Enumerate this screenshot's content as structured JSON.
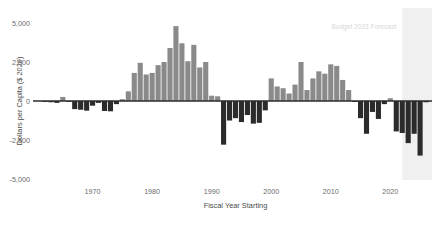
{
  "chart_data": {
    "type": "bar",
    "title": "",
    "xlabel": "Fiscal Year Starting",
    "ylabel": "Dollars per Capita ($ 2020)",
    "xlim": [
      1961,
      2027
    ],
    "ylim": [
      -5000,
      5000
    ],
    "grid": false,
    "legend": null,
    "yticks": [
      5000,
      2500,
      0,
      -2500,
      -5000
    ],
    "ytick_labels": [
      "5,000",
      "2,500",
      "0",
      "-2,500",
      "-5,000"
    ],
    "xticks": [
      1970,
      1980,
      1990,
      2000,
      2010,
      2020
    ],
    "xtick_labels": [
      "1970",
      "1980",
      "1990",
      "2000",
      "2010",
      "2020"
    ],
    "annotations": [
      {
        "text": "Budget 2023 Forecast",
        "x": 2021,
        "y": 4600,
        "color": "#d8d8d8"
      }
    ],
    "shaded_regions": [
      {
        "name": "forecast-band",
        "x_start": 2022,
        "x_end": 2027,
        "color": "#f0f0f0"
      }
    ],
    "colors": {
      "positive_bar": "#8a8a8a",
      "negative_bar": "#2b2b2b",
      "zero_line": "#2b2b2b",
      "tick_text": "#6b6b6b",
      "axis_title": "#4a4a4a",
      "forecast_band": "#f0f0f0",
      "background": "#ffffff"
    },
    "x": [
      1962,
      1963,
      1964,
      1965,
      1966,
      1967,
      1968,
      1969,
      1970,
      1971,
      1972,
      1973,
      1974,
      1975,
      1976,
      1977,
      1978,
      1979,
      1980,
      1981,
      1982,
      1983,
      1984,
      1985,
      1986,
      1987,
      1988,
      1989,
      1990,
      1991,
      1992,
      1993,
      1994,
      1995,
      1996,
      1997,
      1998,
      1999,
      2000,
      2001,
      2002,
      2003,
      2004,
      2005,
      2006,
      2007,
      2008,
      2009,
      2010,
      2011,
      2012,
      2013,
      2014,
      2015,
      2016,
      2017,
      2018,
      2019,
      2020,
      2021,
      2022,
      2023,
      2024,
      2025,
      2026
    ],
    "values": [
      -60,
      -80,
      -120,
      260,
      -40,
      -520,
      -560,
      -620,
      -300,
      -120,
      -640,
      -660,
      -200,
      120,
      620,
      1800,
      2450,
      1700,
      1800,
      2300,
      2500,
      3400,
      4800,
      3700,
      2550,
      3600,
      2150,
      2500,
      340,
      300,
      -2800,
      -1250,
      -1100,
      -1350,
      -900,
      -1450,
      -1400,
      -600,
      1450,
      930,
      820,
      480,
      1050,
      2500,
      700,
      1450,
      1900,
      1750,
      2350,
      2250,
      1350,
      700,
      -60,
      -1100,
      -2100,
      -700,
      -1150,
      -200,
      180,
      -1950,
      -2050,
      -2700,
      -2100,
      -3500,
      -80
    ],
    "series": [
      {
        "name": "Dollars per Capita",
        "values": [
          -60,
          -80,
          -120,
          260,
          -40,
          -520,
          -560,
          -620,
          -300,
          -120,
          -640,
          -660,
          -200,
          120,
          620,
          1800,
          2450,
          1700,
          1800,
          2300,
          2500,
          3400,
          4800,
          3700,
          2550,
          3600,
          2150,
          2500,
          340,
          300,
          -2800,
          -1250,
          -1100,
          -1350,
          -900,
          -1450,
          -1400,
          -600,
          1450,
          930,
          820,
          480,
          1050,
          2500,
          700,
          1450,
          1900,
          1750,
          2350,
          2250,
          1350,
          700,
          -60,
          -1100,
          -2100,
          -700,
          -1150,
          -200,
          180,
          -1950,
          -2050,
          -2700,
          -2100,
          -3500,
          -80
        ]
      }
    ]
  }
}
